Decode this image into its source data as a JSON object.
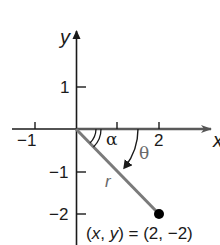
{
  "diagram": {
    "axes": {
      "x_label": "x",
      "y_label": "y",
      "x_ticks": [
        "−1",
        "2"
      ],
      "y_ticks": [
        "1",
        "−1",
        "−2"
      ]
    },
    "angles": {
      "reference_angle": "α",
      "angle": "θ"
    },
    "ray_label": "r",
    "point": {
      "label_prefix_x": "x",
      "label_prefix_y": "y",
      "label_open": "(",
      "label_comma": ", ",
      "label_equals": ") = (2, −2)",
      "coords": [
        2,
        -2
      ]
    },
    "colors": {
      "axis": "#1a1a1a",
      "ray": "#7a7a7a",
      "point": "#000000"
    }
  }
}
